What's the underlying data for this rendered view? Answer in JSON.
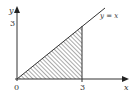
{
  "diagram": {
    "type": "region-under-line",
    "axes": {
      "x_label": "x",
      "y_label": "y",
      "origin_label": "0",
      "x_tick_label": "3",
      "y_tick_label": "3"
    },
    "line": {
      "equation_label": "y = x"
    },
    "region": {
      "description": "triangle bounded by y = x, x-axis and x = 3",
      "vertices": [
        [
          0,
          0
        ],
        [
          3,
          0
        ],
        [
          3,
          3
        ]
      ],
      "fill": "hatched"
    },
    "colors": {
      "stroke": "#333333",
      "hatch": "#555555",
      "background": "#ffffff"
    }
  }
}
